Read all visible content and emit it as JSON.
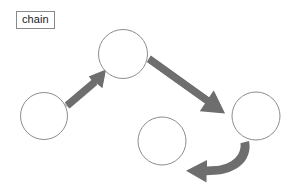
{
  "diagram": {
    "title_label": "chain",
    "canvas": {
      "width": 298,
      "height": 196,
      "background": "#ffffff"
    },
    "colors": {
      "node_stroke": "#8d8d8d",
      "node_fill": "#ffffff",
      "arrow_fill": "#6e6e6e",
      "label_border": "#8a8a8a",
      "label_text": "#1a1a1a",
      "background": "#ffffff"
    },
    "nodes": [
      {
        "id": "node-left",
        "name": "circle-left",
        "label": "",
        "cx": 44,
        "cy": 116,
        "r": 23.5
      },
      {
        "id": "node-top",
        "name": "circle-top",
        "label": "",
        "cx": 123,
        "cy": 54,
        "r": 24.5
      },
      {
        "id": "node-right",
        "name": "circle-right",
        "label": "",
        "cx": 256,
        "cy": 116,
        "r": 24.0
      },
      {
        "id": "node-bottom",
        "name": "circle-bottom-middle",
        "label": "",
        "cx": 162,
        "cy": 141,
        "r": 24.0
      }
    ],
    "edges": [
      {
        "id": "edge-1",
        "name": "arrow-left-to-top",
        "from": "node-left",
        "to": "node-top",
        "style": "straight",
        "direction": "up-right",
        "points": {
          "x1": 66,
          "y1": 101,
          "x2": 101,
          "y2": 71
        }
      },
      {
        "id": "edge-2",
        "name": "arrow-top-to-right",
        "from": "node-top",
        "to": "node-right",
        "style": "straight",
        "direction": "down-right",
        "points": {
          "x1": 150,
          "y1": 58,
          "x2": 224,
          "y2": 111
        }
      },
      {
        "id": "edge-3",
        "name": "arrow-right-to-bottom",
        "from": "node-right",
        "to": "node-bottom",
        "style": "curved",
        "direction": "left",
        "points": {
          "x1": 250,
          "y1": 142,
          "x2": 187,
          "y2": 171
        }
      }
    ]
  }
}
